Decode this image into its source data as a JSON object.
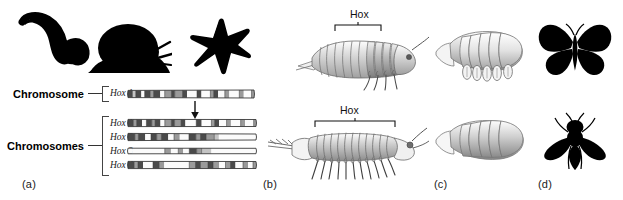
{
  "figure": {
    "background_color": "#ffffff",
    "width": 623,
    "height": 200
  },
  "panels": [
    {
      "id": "a",
      "label": "(a)",
      "x": 22,
      "y": 179
    },
    {
      "id": "b",
      "label": "(b)",
      "x": 263,
      "y": 179
    },
    {
      "id": "c",
      "label": "(c)",
      "x": 434,
      "y": 179
    },
    {
      "id": "d",
      "label": "(d)",
      "x": 538,
      "y": 179
    }
  ],
  "panel_a": {
    "silhouettes": [
      {
        "name": "worm-silhouette",
        "label": "worm",
        "color": "#000000"
      },
      {
        "name": "snail-silhouette",
        "label": "snail",
        "color": "#000000"
      },
      {
        "name": "starfish-silhouette",
        "label": "starfish",
        "color": "#000000"
      }
    ],
    "single_cluster": {
      "label": "Chromosome",
      "genes": [
        "Hox 1"
      ]
    },
    "duplicated_cluster": {
      "label": "Chromosomes",
      "genes": [
        "Hox 1",
        "Hox 2",
        "Hox 3",
        "Hox 4"
      ]
    },
    "arrow": {
      "name": "duplication-arrow",
      "direction": "down"
    },
    "chromosome_bands": {
      "hox1_single": [
        {
          "w": 4,
          "tone": "dark"
        },
        {
          "w": 3,
          "tone": "light"
        },
        {
          "w": 5,
          "tone": "dark"
        },
        {
          "w": 3,
          "tone": "white"
        },
        {
          "w": 5,
          "tone": "dark"
        },
        {
          "w": 3,
          "tone": "mid"
        },
        {
          "w": 6,
          "tone": "dark"
        },
        {
          "w": 4,
          "tone": "white"
        },
        {
          "w": 6,
          "tone": "mid"
        },
        {
          "w": 3,
          "tone": "dark"
        },
        {
          "w": 7,
          "tone": "mid"
        },
        {
          "w": 4,
          "tone": "dark"
        },
        {
          "w": 9,
          "tone": "white"
        },
        {
          "w": 4,
          "tone": "dark"
        },
        {
          "w": 8,
          "tone": "white"
        },
        {
          "w": 3,
          "tone": "mid"
        },
        {
          "w": 4,
          "tone": "dark"
        },
        {
          "w": 6,
          "tone": "white"
        },
        {
          "w": 4,
          "tone": "mid"
        },
        {
          "w": 9,
          "tone": "white"
        },
        {
          "w": 4,
          "tone": "mid"
        },
        {
          "w": 7,
          "tone": "white"
        },
        {
          "w": 4,
          "tone": "mid"
        }
      ],
      "hox1": [
        {
          "w": 5,
          "tone": "dark"
        },
        {
          "w": 3,
          "tone": "mid"
        },
        {
          "w": 5,
          "tone": "dark"
        },
        {
          "w": 4,
          "tone": "white"
        },
        {
          "w": 5,
          "tone": "dark"
        },
        {
          "w": 3,
          "tone": "mid"
        },
        {
          "w": 5,
          "tone": "dark"
        },
        {
          "w": 4,
          "tone": "white"
        },
        {
          "w": 6,
          "tone": "mid"
        },
        {
          "w": 3,
          "tone": "dark"
        },
        {
          "w": 6,
          "tone": "mid"
        },
        {
          "w": 4,
          "tone": "dark"
        },
        {
          "w": 10,
          "tone": "white"
        },
        {
          "w": 5,
          "tone": "dark"
        },
        {
          "w": 9,
          "tone": "white"
        },
        {
          "w": 3,
          "tone": "mid"
        },
        {
          "w": 4,
          "tone": "dark"
        },
        {
          "w": 7,
          "tone": "white"
        },
        {
          "w": 4,
          "tone": "mid"
        },
        {
          "w": 9,
          "tone": "white"
        },
        {
          "w": 4,
          "tone": "mid"
        },
        {
          "w": 8,
          "tone": "white"
        },
        {
          "w": 4,
          "tone": "mid"
        }
      ],
      "hox2": [
        {
          "w": 6,
          "tone": "dark"
        },
        {
          "w": 3,
          "tone": "mid"
        },
        {
          "w": 6,
          "tone": "dark"
        },
        {
          "w": 5,
          "tone": "white"
        },
        {
          "w": 5,
          "tone": "dark"
        },
        {
          "w": 4,
          "tone": "mid"
        },
        {
          "w": 6,
          "tone": "dark"
        },
        {
          "w": 5,
          "tone": "white"
        },
        {
          "w": 5,
          "tone": "mid"
        },
        {
          "w": 8,
          "tone": "white"
        },
        {
          "w": 6,
          "tone": "dark"
        },
        {
          "w": 4,
          "tone": "mid"
        },
        {
          "w": 5,
          "tone": "dark"
        },
        {
          "w": 7,
          "tone": "mid"
        },
        {
          "w": 4,
          "tone": "light"
        },
        {
          "w": 34,
          "tone": "white"
        }
      ],
      "hox3": [
        {
          "w": 4,
          "tone": "white"
        },
        {
          "w": 26,
          "tone": "white"
        },
        {
          "w": 5,
          "tone": "mid"
        },
        {
          "w": 6,
          "tone": "white"
        },
        {
          "w": 4,
          "tone": "mid"
        },
        {
          "w": 5,
          "tone": "white"
        },
        {
          "w": 6,
          "tone": "dark"
        },
        {
          "w": 4,
          "tone": "mid"
        },
        {
          "w": 8,
          "tone": "light"
        },
        {
          "w": 38,
          "tone": "white"
        }
      ],
      "hox4": [
        {
          "w": 5,
          "tone": "dark"
        },
        {
          "w": 3,
          "tone": "mid"
        },
        {
          "w": 4,
          "tone": "dark"
        },
        {
          "w": 8,
          "tone": "white"
        },
        {
          "w": 5,
          "tone": "dark"
        },
        {
          "w": 4,
          "tone": "mid"
        },
        {
          "w": 20,
          "tone": "white"
        },
        {
          "w": 5,
          "tone": "mid"
        },
        {
          "w": 4,
          "tone": "dark"
        },
        {
          "w": 6,
          "tone": "mid"
        },
        {
          "w": 4,
          "tone": "dark"
        },
        {
          "w": 5,
          "tone": "mid"
        },
        {
          "w": 5,
          "tone": "white"
        },
        {
          "w": 4,
          "tone": "mid"
        },
        {
          "w": 4,
          "tone": "dark"
        },
        {
          "w": 6,
          "tone": "white"
        },
        {
          "w": 4,
          "tone": "mid"
        },
        {
          "w": 4,
          "tone": "white"
        },
        {
          "w": 4,
          "tone": "mid"
        }
      ]
    },
    "band_tones": {
      "dark": "#4a4a4a",
      "mid": "#9a9a9a",
      "light": "#c4c4c4",
      "white": "#fbfbfb",
      "outline": "#3a3a3a"
    }
  },
  "panel_b": {
    "organisms": [
      {
        "name": "isopod-crustacean-drawing",
        "hox_label": "Hox",
        "hox_span": "narrow"
      },
      {
        "name": "centipede-myriapod-drawing",
        "hox_label": "Hox",
        "hox_span": "wide"
      }
    ]
  },
  "panel_c": {
    "organisms": [
      {
        "name": "crustacean-embryo-with-limb-buds-drawing"
      },
      {
        "name": "insect-embryo-without-limb-buds-drawing"
      }
    ]
  },
  "panel_d": {
    "organisms": [
      {
        "name": "butterfly-silhouette",
        "color": "#000000"
      },
      {
        "name": "fly-silhouette",
        "color": "#000000"
      }
    ]
  }
}
